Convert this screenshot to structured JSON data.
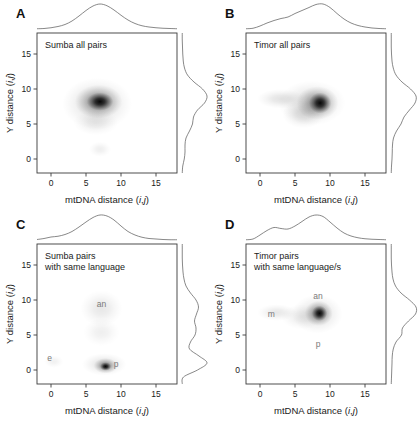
{
  "figure": {
    "background": "#ffffff",
    "ink": "#1a1a1a",
    "density_color": "#000000",
    "margin_curve_color": "#555555",
    "annotation_color": "#7a7a7a"
  },
  "axes": {
    "x_title_prefix": "mtDNA distance (",
    "x_title_i": "i",
    "x_title_comma": ",",
    "x_title_j": "j",
    "x_title_suffix": ")",
    "y_title_prefix": "Y distance (",
    "y_title_i": "i",
    "y_title_comma": ",",
    "y_title_j": "j",
    "y_title_suffix": ")",
    "x_ticks": [
      "0",
      "5",
      "10",
      "15"
    ],
    "y_ticks": [
      "0",
      "5",
      "10",
      "15"
    ],
    "x_tick_values": [
      0,
      5,
      10,
      15
    ],
    "y_tick_values": [
      0,
      5,
      10,
      15
    ],
    "xlim": [
      -2,
      18
    ],
    "ylim": [
      -2,
      18
    ]
  },
  "panels": [
    {
      "letter": "A",
      "title_line1": "Sumba all pairs",
      "title_line2": "",
      "annotations": []
    },
    {
      "letter": "B",
      "title_line1": "Timor all pairs",
      "title_line2": "",
      "annotations": []
    },
    {
      "letter": "C",
      "title_line1": "Sumba pairs",
      "title_line2": "with same language",
      "annotations": [
        {
          "label": "an",
          "x": 7.2,
          "y": 9.0
        },
        {
          "label": "e",
          "x": -0.2,
          "y": 1.3
        },
        {
          "label": "p",
          "x": 9.3,
          "y": 0.5
        }
      ]
    },
    {
      "letter": "D",
      "title_line1": "Timor pairs",
      "title_line2": "with same language/s",
      "annotations": [
        {
          "label": "an",
          "x": 8.3,
          "y": 10.2
        },
        {
          "label": "m",
          "x": 1.6,
          "y": 7.6
        },
        {
          "label": "p",
          "x": 8.3,
          "y": 3.3
        }
      ]
    }
  ],
  "chart_data": {
    "type": "scatter",
    "xlabel": "mtDNA distance (i,j)",
    "ylabel": "Y distance (i,j)",
    "xlim": [
      -2,
      18
    ],
    "ylim": [
      -2,
      18
    ],
    "xticks": [
      0,
      5,
      10,
      15
    ],
    "yticks": [
      0,
      5,
      10,
      15
    ],
    "grid": false,
    "legend": "none",
    "panels": [
      {
        "letter": "A",
        "label": "Sumba all pairs",
        "blobs": [
          {
            "cx": 7.0,
            "cy": 8.2,
            "rx": 1.9,
            "ry": 1.3,
            "peak": 1.0
          },
          {
            "cx": 6.8,
            "cy": 8.2,
            "rx": 3.4,
            "ry": 2.4,
            "peak": 0.42
          },
          {
            "cx": 6.6,
            "cy": 7.9,
            "rx": 5.0,
            "ry": 3.7,
            "peak": 0.16
          },
          {
            "cx": 6.4,
            "cy": 5.2,
            "rx": 3.2,
            "ry": 1.8,
            "peak": 0.09
          },
          {
            "cx": 7.0,
            "cy": 1.4,
            "rx": 1.6,
            "ry": 1.1,
            "peak": 0.07
          }
        ],
        "marginal_x": [
          [
            -2,
            0.01
          ],
          [
            -1,
            0.02
          ],
          [
            0,
            0.05
          ],
          [
            1,
            0.1
          ],
          [
            2,
            0.18
          ],
          [
            3,
            0.32
          ],
          [
            4,
            0.52
          ],
          [
            5,
            0.74
          ],
          [
            6,
            0.92
          ],
          [
            7,
            1.0
          ],
          [
            8,
            0.93
          ],
          [
            9,
            0.76
          ],
          [
            10,
            0.55
          ],
          [
            11,
            0.36
          ],
          [
            12,
            0.22
          ],
          [
            13,
            0.13
          ],
          [
            14,
            0.08
          ],
          [
            15,
            0.05
          ],
          [
            16,
            0.03
          ],
          [
            17,
            0.02
          ],
          [
            18,
            0.01
          ]
        ],
        "marginal_y": [
          [
            -2,
            0.01
          ],
          [
            -1,
            0.03
          ],
          [
            0,
            0.09
          ],
          [
            1,
            0.12
          ],
          [
            2,
            0.12
          ],
          [
            3,
            0.16
          ],
          [
            4,
            0.3
          ],
          [
            5,
            0.42
          ],
          [
            6,
            0.46
          ],
          [
            7,
            0.62
          ],
          [
            8,
            0.9
          ],
          [
            9,
            1.0
          ],
          [
            10,
            0.82
          ],
          [
            11,
            0.48
          ],
          [
            12,
            0.22
          ],
          [
            13,
            0.1
          ],
          [
            14,
            0.05
          ],
          [
            15,
            0.03
          ],
          [
            16,
            0.02
          ],
          [
            17,
            0.01
          ],
          [
            18,
            0.01
          ]
        ]
      },
      {
        "letter": "B",
        "label": "Timor all pairs",
        "blobs": [
          {
            "cx": 8.6,
            "cy": 8.0,
            "rx": 1.6,
            "ry": 1.5,
            "peak": 1.0
          },
          {
            "cx": 8.2,
            "cy": 8.0,
            "rx": 3.0,
            "ry": 2.4,
            "peak": 0.4
          },
          {
            "cx": 7.4,
            "cy": 8.0,
            "rx": 4.8,
            "ry": 3.2,
            "peak": 0.15
          },
          {
            "cx": 3.0,
            "cy": 8.6,
            "rx": 3.4,
            "ry": 1.4,
            "peak": 0.12
          },
          {
            "cx": 6.2,
            "cy": 6.4,
            "rx": 3.0,
            "ry": 2.0,
            "peak": 0.13
          }
        ],
        "marginal_x": [
          [
            -2,
            0.01
          ],
          [
            -1,
            0.03
          ],
          [
            0,
            0.12
          ],
          [
            1,
            0.24
          ],
          [
            2,
            0.34
          ],
          [
            3,
            0.42
          ],
          [
            4,
            0.48
          ],
          [
            5,
            0.62
          ],
          [
            6,
            0.74
          ],
          [
            7,
            0.86
          ],
          [
            8,
            0.98
          ],
          [
            9,
            1.0
          ],
          [
            10,
            0.86
          ],
          [
            11,
            0.62
          ],
          [
            12,
            0.4
          ],
          [
            13,
            0.24
          ],
          [
            14,
            0.14
          ],
          [
            15,
            0.08
          ],
          [
            16,
            0.04
          ],
          [
            17,
            0.02
          ],
          [
            18,
            0.01
          ]
        ],
        "marginal_y": [
          [
            -2,
            0.01
          ],
          [
            -1,
            0.02
          ],
          [
            0,
            0.04
          ],
          [
            1,
            0.05
          ],
          [
            2,
            0.06
          ],
          [
            3,
            0.1
          ],
          [
            4,
            0.22
          ],
          [
            5,
            0.4
          ],
          [
            6,
            0.52
          ],
          [
            7,
            0.74
          ],
          [
            8,
            0.96
          ],
          [
            9,
            1.0
          ],
          [
            10,
            0.78
          ],
          [
            11,
            0.44
          ],
          [
            12,
            0.2
          ],
          [
            13,
            0.09
          ],
          [
            14,
            0.04
          ],
          [
            15,
            0.02
          ],
          [
            16,
            0.01
          ],
          [
            17,
            0.01
          ],
          [
            18,
            0.01
          ]
        ]
      },
      {
        "letter": "C",
        "label": "Sumba pairs with same language",
        "blobs": [
          {
            "cx": 7.8,
            "cy": 0.5,
            "rx": 0.8,
            "ry": 0.6,
            "peak": 1.0
          },
          {
            "cx": 7.8,
            "cy": 0.6,
            "rx": 1.7,
            "ry": 1.1,
            "peak": 0.45
          },
          {
            "cx": 7.6,
            "cy": 0.8,
            "rx": 3.2,
            "ry": 1.6,
            "peak": 0.13
          },
          {
            "cx": 7.2,
            "cy": 8.8,
            "rx": 3.0,
            "ry": 2.6,
            "peak": 0.1
          },
          {
            "cx": 7.2,
            "cy": 5.4,
            "rx": 2.6,
            "ry": 2.0,
            "peak": 0.07
          },
          {
            "cx": 0.4,
            "cy": 1.2,
            "rx": 1.4,
            "ry": 0.9,
            "peak": 0.06
          }
        ],
        "marginal_x": [
          [
            -2,
            0.02
          ],
          [
            -1,
            0.06
          ],
          [
            0,
            0.12
          ],
          [
            1,
            0.15
          ],
          [
            2,
            0.22
          ],
          [
            3,
            0.34
          ],
          [
            4,
            0.52
          ],
          [
            5,
            0.72
          ],
          [
            6,
            0.9
          ],
          [
            7,
            1.0
          ],
          [
            8,
            0.96
          ],
          [
            9,
            0.8
          ],
          [
            10,
            0.56
          ],
          [
            11,
            0.34
          ],
          [
            12,
            0.2
          ],
          [
            13,
            0.11
          ],
          [
            14,
            0.06
          ],
          [
            15,
            0.04
          ],
          [
            16,
            0.02
          ],
          [
            17,
            0.01
          ],
          [
            18,
            0.01
          ]
        ],
        "marginal_y": [
          [
            -2,
            0.01
          ],
          [
            -1,
            0.06
          ],
          [
            0,
            0.62
          ],
          [
            1,
            1.0
          ],
          [
            2,
            0.68
          ],
          [
            3,
            0.3
          ],
          [
            4,
            0.34
          ],
          [
            5,
            0.52
          ],
          [
            6,
            0.56
          ],
          [
            7,
            0.5
          ],
          [
            8,
            0.58
          ],
          [
            9,
            0.66
          ],
          [
            10,
            0.56
          ],
          [
            11,
            0.34
          ],
          [
            12,
            0.16
          ],
          [
            13,
            0.08
          ],
          [
            14,
            0.04
          ],
          [
            15,
            0.02
          ],
          [
            16,
            0.01
          ],
          [
            17,
            0.01
          ],
          [
            18,
            0.01
          ]
        ]
      },
      {
        "letter": "D",
        "label": "Timor pairs with same language/s",
        "blobs": [
          {
            "cx": 8.5,
            "cy": 8.1,
            "rx": 1.1,
            "ry": 1.1,
            "peak": 1.0
          },
          {
            "cx": 8.4,
            "cy": 8.1,
            "rx": 2.0,
            "ry": 1.8,
            "peak": 0.46
          },
          {
            "cx": 8.2,
            "cy": 8.0,
            "rx": 3.6,
            "ry": 2.8,
            "peak": 0.14
          },
          {
            "cx": 2.4,
            "cy": 8.2,
            "rx": 2.8,
            "ry": 1.2,
            "peak": 0.1
          },
          {
            "cx": 6.0,
            "cy": 7.6,
            "rx": 3.0,
            "ry": 1.8,
            "peak": 0.09
          }
        ],
        "marginal_x": [
          [
            -2,
            0.01
          ],
          [
            -1,
            0.04
          ],
          [
            0,
            0.2
          ],
          [
            1,
            0.38
          ],
          [
            2,
            0.5
          ],
          [
            3,
            0.46
          ],
          [
            4,
            0.44
          ],
          [
            5,
            0.56
          ],
          [
            6,
            0.74
          ],
          [
            7,
            0.92
          ],
          [
            8,
            1.0
          ],
          [
            9,
            0.94
          ],
          [
            10,
            0.72
          ],
          [
            11,
            0.48
          ],
          [
            12,
            0.28
          ],
          [
            13,
            0.16
          ],
          [
            14,
            0.09
          ],
          [
            15,
            0.05
          ],
          [
            16,
            0.03
          ],
          [
            17,
            0.02
          ],
          [
            18,
            0.01
          ]
        ],
        "marginal_y": [
          [
            -2,
            0.01
          ],
          [
            -1,
            0.02
          ],
          [
            0,
            0.03
          ],
          [
            1,
            0.04
          ],
          [
            2,
            0.05
          ],
          [
            3,
            0.09
          ],
          [
            4,
            0.2
          ],
          [
            5,
            0.42
          ],
          [
            6,
            0.46
          ],
          [
            7,
            0.7
          ],
          [
            8,
            0.98
          ],
          [
            9,
            1.0
          ],
          [
            10,
            0.74
          ],
          [
            11,
            0.4
          ],
          [
            12,
            0.18
          ],
          [
            13,
            0.08
          ],
          [
            14,
            0.04
          ],
          [
            15,
            0.02
          ],
          [
            16,
            0.01
          ],
          [
            17,
            0.01
          ],
          [
            18,
            0.01
          ]
        ]
      }
    ]
  }
}
